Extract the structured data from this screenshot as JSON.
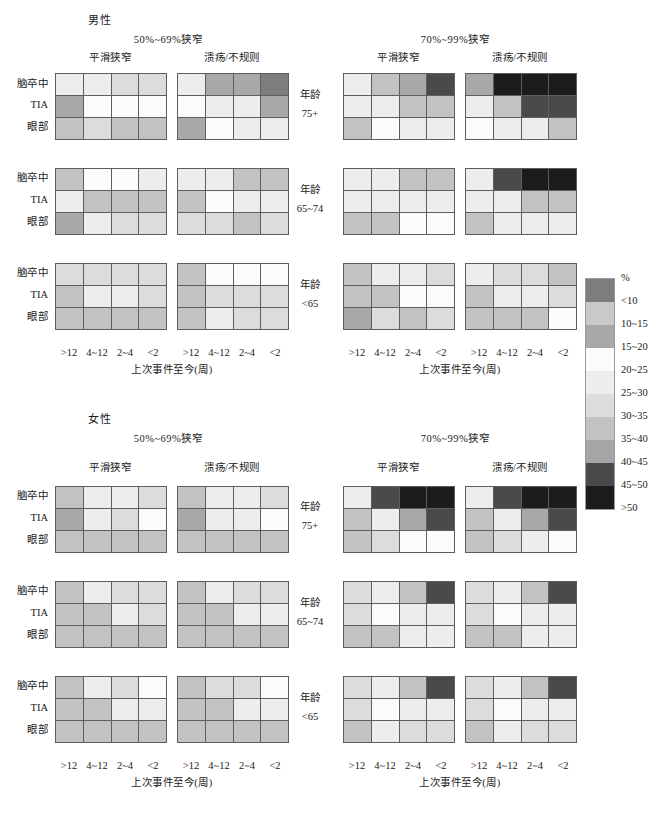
{
  "figure": {
    "axis_x_title": "上次事件至今(周)",
    "x_ticks": [
      ">12",
      "4~12",
      "2~4",
      "<2"
    ],
    "y_ticks": [
      "脑卒中",
      "TIA",
      "眼部"
    ],
    "age_label": "年龄",
    "age_groups": [
      "75+",
      "65~74",
      "<65"
    ],
    "stenosis_groups": [
      "50%~69%狭窄",
      "70%~99%狭窄"
    ],
    "plaque_types": [
      "平滑狭窄",
      "溃疡/不规则"
    ],
    "sexes": [
      "男性",
      "女性"
    ]
  },
  "legend": {
    "title": "%",
    "labels": [
      "<10",
      "10~15",
      "15~20",
      "20~25",
      "25~30",
      "30~35",
      "35~40",
      "40~45",
      "45~50",
      ">50"
    ],
    "colors": [
      "#7d7d7d",
      "#c9c9c9",
      "#a8a8a8",
      "#fbfbfb",
      "#ededed",
      "#dcdcdc",
      "#c2c2c2",
      "#a5a5a5",
      "#4a4a4a",
      "#1c1c1c"
    ]
  },
  "chart_data": {
    "type": "heatmap",
    "title": "",
    "xlabel": "上次事件至今(周)",
    "ylabel": "",
    "x": [
      ">12",
      "4~12",
      "2~4",
      "<2"
    ],
    "y": [
      "脑卒中",
      "TIA",
      "眼部"
    ],
    "colorbar": {
      "title": "%",
      "bins": [
        "<10",
        "10~15",
        "15~20",
        "20~25",
        "25~30",
        "30~35",
        "35~40",
        "40~45",
        "45~50",
        ">50"
      ],
      "colors": [
        "#7d7d7d",
        "#c9c9c9",
        "#a8a8a8",
        "#fbfbfb",
        "#ededed",
        "#dcdcdc",
        "#c2c2c2",
        "#a5a5a5",
        "#4a4a4a",
        "#1c1c1c"
      ]
    },
    "legend_position": "right",
    "grid": false,
    "panels": [
      {
        "sex": "男性",
        "stenosis": "50%~69%狭窄",
        "plaque": "平滑狭窄",
        "age": "75+",
        "bins": [
          [
            "25~30",
            "25~30",
            "30~35",
            "30~35"
          ],
          [
            "15~20",
            "20~25",
            "20~25",
            "20~25"
          ],
          [
            "35~40",
            "30~35",
            "35~40",
            "35~40"
          ]
        ]
      },
      {
        "sex": "男性",
        "stenosis": "50%~69%狭窄",
        "plaque": "溃疡/不规则",
        "age": "75+",
        "bins": [
          [
            "25~30",
            "15~20",
            "15~20",
            "<10"
          ],
          [
            "20~25",
            "25~30",
            "25~30",
            "15~20"
          ],
          [
            "15~20",
            "20~25",
            "25~30",
            "25~30"
          ]
        ]
      },
      {
        "sex": "男性",
        "stenosis": "70%~99%狭窄",
        "plaque": "平滑狭窄",
        "age": "75+",
        "bins": [
          [
            "25~30",
            "35~40",
            "15~20",
            "45~50"
          ],
          [
            "25~30",
            "25~30",
            "35~40",
            "35~40"
          ],
          [
            "35~40",
            "20~25",
            "25~30",
            "25~30"
          ]
        ]
      },
      {
        "sex": "男性",
        "stenosis": "70%~99%狭窄",
        "plaque": "溃疡/不规则",
        "age": "75+",
        "bins": [
          [
            "15~20",
            ">50",
            ">50",
            ">50"
          ],
          [
            "25~30",
            "35~40",
            "45~50",
            "45~50"
          ],
          [
            "20~25",
            "25~30",
            "25~30",
            "35~40"
          ]
        ]
      },
      {
        "sex": "男性",
        "stenosis": "50%~69%狭窄",
        "plaque": "平滑狭窄",
        "age": "65~74",
        "bins": [
          [
            "35~40",
            "20~25",
            "20~25",
            "25~30"
          ],
          [
            "25~30",
            "35~40",
            "35~40",
            "35~40"
          ],
          [
            "15~20",
            "25~30",
            "30~35",
            "30~35"
          ]
        ]
      },
      {
        "sex": "男性",
        "stenosis": "50%~69%狭窄",
        "plaque": "溃疡/不规则",
        "age": "65~74",
        "bins": [
          [
            "25~30",
            "25~30",
            "35~40",
            "35~40"
          ],
          [
            "35~40",
            "20~25",
            "25~30",
            "25~30"
          ],
          [
            "30~35",
            "30~35",
            "35~40",
            "30~35"
          ]
        ]
      },
      {
        "sex": "男性",
        "stenosis": "70%~99%狭窄",
        "plaque": "平滑狭窄",
        "age": "65~74",
        "bins": [
          [
            "25~30",
            "25~30",
            "35~40",
            "35~40"
          ],
          [
            "25~30",
            "25~30",
            "25~30",
            "25~30"
          ],
          [
            "35~40",
            "35~40",
            "20~25",
            "20~25"
          ]
        ]
      },
      {
        "sex": "男性",
        "stenosis": "70%~99%狭窄",
        "plaque": "溃疡/不规则",
        "age": "65~74",
        "bins": [
          [
            "25~30",
            "45~50",
            ">50",
            ">50"
          ],
          [
            "25~30",
            "25~30",
            "35~40",
            "35~40"
          ],
          [
            "35~40",
            "25~30",
            "25~30",
            "25~30"
          ]
        ]
      },
      {
        "sex": "男性",
        "stenosis": "50%~69%狭窄",
        "plaque": "平滑狭窄",
        "age": "<65",
        "bins": [
          [
            "30~35",
            "30~35",
            "30~35",
            "30~35"
          ],
          [
            "35~40",
            "25~30",
            "25~30",
            "30~35"
          ],
          [
            "35~40",
            "35~40",
            "35~40",
            "35~40"
          ]
        ]
      },
      {
        "sex": "男性",
        "stenosis": "50%~69%狭窄",
        "plaque": "溃疡/不规则",
        "age": "<65",
        "bins": [
          [
            "35~40",
            "20~25",
            "20~25",
            "20~25"
          ],
          [
            "35~40",
            "30~35",
            "30~35",
            "30~35"
          ],
          [
            "35~40",
            "25~30",
            "30~35",
            "30~35"
          ]
        ]
      },
      {
        "sex": "男性",
        "stenosis": "70%~99%狭窄",
        "plaque": "平滑狭窄",
        "age": "<65",
        "bins": [
          [
            "35~40",
            "25~30",
            "25~30",
            "30~35"
          ],
          [
            "35~40",
            "35~40",
            "20~25",
            "20~25"
          ],
          [
            "15~20",
            "30~35",
            "35~40",
            "30~35"
          ]
        ]
      },
      {
        "sex": "男性",
        "stenosis": "70%~99%狭窄",
        "plaque": "溃疡/不规则",
        "age": "<65",
        "bins": [
          [
            "25~30",
            "30~35",
            "30~35",
            "35~40"
          ],
          [
            "35~40",
            "25~30",
            "25~30",
            "30~35"
          ],
          [
            "35~40",
            "35~40",
            "35~40",
            "20~25"
          ]
        ]
      },
      {
        "sex": "女性",
        "stenosis": "50%~69%狭窄",
        "plaque": "平滑狭窄",
        "age": "75+",
        "bins": [
          [
            "35~40",
            "25~30",
            "25~30",
            "30~35"
          ],
          [
            "15~20",
            "25~30",
            "30~35",
            "20~25"
          ],
          [
            "35~40",
            "35~40",
            "35~40",
            "35~40"
          ]
        ]
      },
      {
        "sex": "女性",
        "stenosis": "50%~69%狭窄",
        "plaque": "溃疡/不规则",
        "age": "75+",
        "bins": [
          [
            "35~40",
            "25~30",
            "25~30",
            "30~35"
          ],
          [
            "15~20",
            "25~30",
            "25~30",
            "20~25"
          ],
          [
            "35~40",
            "35~40",
            "35~40",
            "35~40"
          ]
        ]
      },
      {
        "sex": "女性",
        "stenosis": "70%~99%狭窄",
        "plaque": "平滑狭窄",
        "age": "75+",
        "bins": [
          [
            "25~30",
            "45~50",
            ">50",
            ">50"
          ],
          [
            "35~40",
            "25~30",
            "15~20",
            "45~50"
          ],
          [
            "35~40",
            "30~35",
            "20~25",
            "20~25"
          ]
        ]
      },
      {
        "sex": "女性",
        "stenosis": "70%~99%狭窄",
        "plaque": "溃疡/不规则",
        "age": "75+",
        "bins": [
          [
            "25~30",
            "45~50",
            ">50",
            ">50"
          ],
          [
            "35~40",
            "25~30",
            "15~20",
            "45~50"
          ],
          [
            "35~40",
            "30~35",
            "25~30",
            "20~25"
          ]
        ]
      },
      {
        "sex": "女性",
        "stenosis": "50%~69%狭窄",
        "plaque": "平滑狭窄",
        "age": "65~74",
        "bins": [
          [
            "35~40",
            "25~30",
            "30~35",
            "30~35"
          ],
          [
            "35~40",
            "35~40",
            "25~30",
            "30~35"
          ],
          [
            "35~40",
            "35~40",
            "35~40",
            "35~40"
          ]
        ]
      },
      {
        "sex": "女性",
        "stenosis": "50%~69%狭窄",
        "plaque": "溃疡/不规则",
        "age": "65~74",
        "bins": [
          [
            "35~40",
            "25~30",
            "30~35",
            "30~35"
          ],
          [
            "35~40",
            "35~40",
            "25~30",
            "25~30"
          ],
          [
            "35~40",
            "35~40",
            "35~40",
            "35~40"
          ]
        ]
      },
      {
        "sex": "女性",
        "stenosis": "70%~99%狭窄",
        "plaque": "平滑狭窄",
        "age": "65~74",
        "bins": [
          [
            "30~35",
            "25~30",
            "35~40",
            "45~50"
          ],
          [
            "30~35",
            "20~25",
            "25~30",
            "25~30"
          ],
          [
            "35~40",
            "35~40",
            "25~30",
            "25~30"
          ]
        ]
      },
      {
        "sex": "女性",
        "stenosis": "70%~99%狭窄",
        "plaque": "溃疡/不规则",
        "age": "65~74",
        "bins": [
          [
            "30~35",
            "25~30",
            "35~40",
            "45~50"
          ],
          [
            "30~35",
            "20~25",
            "25~30",
            "25~30"
          ],
          [
            "35~40",
            "35~40",
            "25~30",
            "25~30"
          ]
        ]
      },
      {
        "sex": "女性",
        "stenosis": "50%~69%狭窄",
        "plaque": "平滑狭窄",
        "age": "<65",
        "bins": [
          [
            "35~40",
            "25~30",
            "30~35",
            "20~25"
          ],
          [
            "35~40",
            "35~40",
            "25~30",
            "25~30"
          ],
          [
            "35~40",
            "35~40",
            "35~40",
            "35~40"
          ]
        ]
      },
      {
        "sex": "女性",
        "stenosis": "50%~69%狭窄",
        "plaque": "溃疡/不规则",
        "age": "<65",
        "bins": [
          [
            "35~40",
            "30~35",
            "30~35",
            "20~25"
          ],
          [
            "35~40",
            "35~40",
            "25~30",
            "25~30"
          ],
          [
            "35~40",
            "35~40",
            "35~40",
            "35~40"
          ]
        ]
      },
      {
        "sex": "女性",
        "stenosis": "70%~99%狭窄",
        "plaque": "平滑狭窄",
        "age": "<65",
        "bins": [
          [
            "30~35",
            "25~30",
            "35~40",
            "45~50"
          ],
          [
            "30~35",
            "20~25",
            "25~30",
            "25~30"
          ],
          [
            "35~40",
            "25~30",
            "30~35",
            "30~35"
          ]
        ]
      },
      {
        "sex": "女性",
        "stenosis": "70%~99%狭窄",
        "plaque": "溃疡/不规则",
        "age": "<65",
        "bins": [
          [
            "30~35",
            "25~30",
            "35~40",
            "45~50"
          ],
          [
            "30~35",
            "20~25",
            "25~30",
            "25~30"
          ],
          [
            "35~40",
            "25~30",
            "30~35",
            "30~35"
          ]
        ]
      }
    ]
  }
}
